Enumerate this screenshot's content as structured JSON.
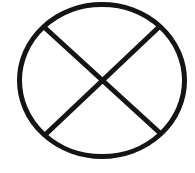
{
  "icon": {
    "name": "circle-x-icon",
    "stroke_color": "#141414",
    "background_color": "#ffffff",
    "stroke_width": 5,
    "ellipse": {
      "cx": 102,
      "cy": 80.5,
      "rx": 82.5,
      "ry": 76
    },
    "line_a": {
      "x1": 44,
      "y1": 27,
      "x2": 160,
      "y2": 133
    },
    "line_b": {
      "x1": 159,
      "y1": 27,
      "x2": 46,
      "y2": 134
    }
  }
}
